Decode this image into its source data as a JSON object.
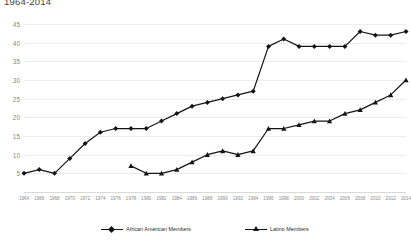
{
  "chart_data": {
    "type": "line",
    "title": "1964-2014",
    "xlabel": "",
    "ylabel": "",
    "ylim": [
      0,
      45
    ],
    "yticks": [
      45,
      40,
      35,
      30,
      25,
      20,
      15,
      10,
      5
    ],
    "grid": true,
    "legend_position": "bottom",
    "categories": [
      "1964",
      "1966",
      "1968",
      "1970",
      "1972",
      "1974",
      "1976",
      "1978",
      "1980",
      "1982",
      "1984",
      "1986",
      "1988",
      "1990",
      "1992",
      "1994",
      "1996",
      "1998",
      "2000",
      "2002",
      "2004",
      "2006",
      "2008",
      "2010",
      "2012",
      "2014"
    ],
    "series": [
      {
        "name": "African American Members",
        "marker": "diamond",
        "color": "#151515",
        "values": [
          5,
          6,
          5,
          9,
          13,
          16,
          17,
          17,
          17,
          19,
          21,
          23,
          24,
          25,
          26,
          27,
          39,
          41,
          39,
          39,
          39,
          39,
          43,
          42,
          42,
          43
        ]
      },
      {
        "name": "Latino Members",
        "marker": "triangle",
        "color": "#151515",
        "values": [
          null,
          null,
          null,
          null,
          null,
          null,
          null,
          7,
          5,
          5,
          6,
          8,
          10,
          11,
          10,
          11,
          17,
          17,
          18,
          19,
          19,
          21,
          22,
          24,
          26,
          30
        ]
      }
    ]
  },
  "legend": {
    "items": [
      {
        "label": "African American Members"
      },
      {
        "label": "Latino Members"
      }
    ]
  },
  "colors": {
    "series_line": "#151515",
    "grid": "#ebebeb",
    "axis": "#d9d9d9",
    "tick_text": "#8a8a8a"
  }
}
